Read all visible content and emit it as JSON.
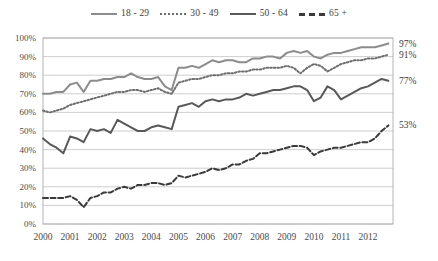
{
  "chart_data": {
    "type": "line",
    "title": "",
    "subtitle": "",
    "xlabel": "",
    "ylabel": "",
    "xlim": [
      2000,
      2012.92
    ],
    "ylim": [
      0,
      100
    ],
    "yticks": [
      "0%",
      "10%",
      "20%",
      "30%",
      "40%",
      "50%",
      "60%",
      "70%",
      "80%",
      "90%",
      "100%"
    ],
    "ytick_values": [
      0,
      10,
      20,
      30,
      40,
      50,
      60,
      70,
      80,
      90,
      100
    ],
    "xticks": [
      "2000",
      "2001",
      "2002",
      "2003",
      "2004",
      "2005",
      "2006",
      "2007",
      "2008",
      "2009",
      "2010",
      "2011",
      "2012"
    ],
    "xtick_values": [
      2000,
      2001,
      2002,
      2003,
      2004,
      2005,
      2006,
      2007,
      2008,
      2009,
      2010,
      2011,
      2012
    ],
    "grid": "horizontal",
    "legend_position": "top-center",
    "series": [
      {
        "name": "18 - 29",
        "style": "solid",
        "color": "#8c8c8c",
        "width": 2,
        "end_label": "97%",
        "end_value": 97,
        "x": [
          2000.0,
          2000.25,
          2000.5,
          2000.75,
          2001.0,
          2001.25,
          2001.5,
          2001.75,
          2002.0,
          2002.25,
          2002.5,
          2002.75,
          2003.0,
          2003.25,
          2003.5,
          2003.75,
          2004.0,
          2004.25,
          2004.5,
          2004.75,
          2005.0,
          2005.25,
          2005.5,
          2005.75,
          2006.0,
          2006.25,
          2006.5,
          2006.75,
          2007.0,
          2007.25,
          2007.5,
          2007.75,
          2008.0,
          2008.25,
          2008.5,
          2008.75,
          2009.0,
          2009.25,
          2009.5,
          2009.75,
          2010.0,
          2010.25,
          2010.5,
          2010.75,
          2011.0,
          2011.25,
          2011.5,
          2011.75,
          2012.0,
          2012.25,
          2012.5,
          2012.75
        ],
        "values": [
          70,
          70,
          71,
          71,
          75,
          76,
          71,
          77,
          77,
          78,
          78,
          79,
          79,
          81,
          79,
          78,
          78,
          79,
          74,
          72,
          84,
          84,
          85,
          84,
          86,
          88,
          87,
          88,
          88,
          87,
          87,
          89,
          89,
          90,
          90,
          89,
          92,
          93,
          92,
          93,
          90,
          89,
          91,
          92,
          92,
          93,
          94,
          95,
          95,
          95,
          96,
          97
        ]
      },
      {
        "name": "30 - 49",
        "style": "dotted",
        "color": "#6e6e6e",
        "width": 2,
        "end_label": "91%",
        "end_value": 91,
        "x": [
          2000.0,
          2000.25,
          2000.5,
          2000.75,
          2001.0,
          2001.25,
          2001.5,
          2001.75,
          2002.0,
          2002.25,
          2002.5,
          2002.75,
          2003.0,
          2003.25,
          2003.5,
          2003.75,
          2004.0,
          2004.25,
          2004.5,
          2004.75,
          2005.0,
          2005.25,
          2005.5,
          2005.75,
          2006.0,
          2006.25,
          2006.5,
          2006.75,
          2007.0,
          2007.25,
          2007.5,
          2007.75,
          2008.0,
          2008.25,
          2008.5,
          2008.75,
          2009.0,
          2009.25,
          2009.5,
          2009.75,
          2010.0,
          2010.25,
          2010.5,
          2010.75,
          2011.0,
          2011.25,
          2011.5,
          2011.75,
          2012.0,
          2012.25,
          2012.5,
          2012.75
        ],
        "values": [
          61,
          60,
          61,
          62,
          64,
          65,
          66,
          67,
          68,
          69,
          70,
          71,
          71,
          72,
          72,
          71,
          72,
          73,
          71,
          70,
          76,
          77,
          78,
          78,
          79,
          80,
          80,
          81,
          81,
          82,
          82,
          83,
          83,
          84,
          84,
          84,
          85,
          84,
          81,
          84,
          86,
          85,
          82,
          84,
          86,
          87,
          88,
          88,
          89,
          89,
          90,
          91
        ]
      },
      {
        "name": "50 - 64",
        "style": "solid",
        "color": "#595959",
        "width": 2,
        "end_label": "77%",
        "end_value": 77,
        "x": [
          2000.0,
          2000.25,
          2000.5,
          2000.75,
          2001.0,
          2001.25,
          2001.5,
          2001.75,
          2002.0,
          2002.25,
          2002.5,
          2002.75,
          2003.0,
          2003.25,
          2003.5,
          2003.75,
          2004.0,
          2004.25,
          2004.5,
          2004.75,
          2005.0,
          2005.25,
          2005.5,
          2005.75,
          2006.0,
          2006.25,
          2006.5,
          2006.75,
          2007.0,
          2007.25,
          2007.5,
          2007.75,
          2008.0,
          2008.25,
          2008.5,
          2008.75,
          2009.0,
          2009.25,
          2009.5,
          2009.75,
          2010.0,
          2010.25,
          2010.5,
          2010.75,
          2011.0,
          2011.25,
          2011.5,
          2011.75,
          2012.0,
          2012.25,
          2012.5,
          2012.75
        ],
        "values": [
          46,
          43,
          41,
          38,
          47,
          46,
          44,
          51,
          50,
          51,
          49,
          56,
          54,
          52,
          50,
          50,
          52,
          53,
          52,
          51,
          63,
          64,
          65,
          63,
          66,
          67,
          66,
          67,
          67,
          68,
          70,
          69,
          70,
          71,
          72,
          72,
          73,
          74,
          74,
          72,
          66,
          68,
          74,
          72,
          67,
          69,
          71,
          73,
          74,
          76,
          78,
          77
        ]
      },
      {
        "name": "65 +",
        "style": "dashed",
        "color": "#3a3a3a",
        "width": 2,
        "end_label": "53%",
        "end_value": 53,
        "x": [
          2000.0,
          2000.25,
          2000.5,
          2000.75,
          2001.0,
          2001.25,
          2001.5,
          2001.75,
          2002.0,
          2002.25,
          2002.5,
          2002.75,
          2003.0,
          2003.25,
          2003.5,
          2003.75,
          2004.0,
          2004.25,
          2004.5,
          2004.75,
          2005.0,
          2005.25,
          2005.5,
          2005.75,
          2006.0,
          2006.25,
          2006.5,
          2006.75,
          2007.0,
          2007.25,
          2007.5,
          2007.75,
          2008.0,
          2008.25,
          2008.5,
          2008.75,
          2009.0,
          2009.25,
          2009.5,
          2009.75,
          2010.0,
          2010.25,
          2010.5,
          2010.75,
          2011.0,
          2011.25,
          2011.5,
          2011.75,
          2012.0,
          2012.25,
          2012.5,
          2012.75
        ],
        "values": [
          14,
          14,
          14,
          14,
          15,
          13,
          9,
          14,
          15,
          17,
          17,
          19,
          20,
          19,
          21,
          21,
          22,
          22,
          21,
          22,
          26,
          25,
          26,
          27,
          28,
          30,
          29,
          30,
          32,
          32,
          34,
          35,
          38,
          38,
          39,
          40,
          41,
          42,
          42,
          41,
          37,
          39,
          40,
          41,
          41,
          42,
          43,
          44,
          44,
          46,
          50,
          53
        ]
      }
    ]
  }
}
